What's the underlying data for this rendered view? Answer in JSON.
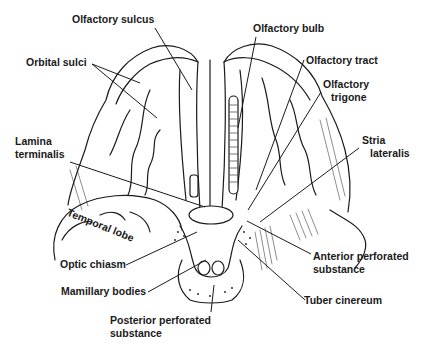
{
  "diagram": {
    "labels": {
      "olfactory_sulcus": "Olfactory sulcus",
      "olfactory_bulb": "Olfactory bulb",
      "orbital_sulci": "Orbital sulci",
      "olfactory_tract": "Olfactory tract",
      "olfactory_trigone_1": "Olfactory",
      "olfactory_trigone_2": "trigone",
      "lamina_terminalis_1": "Lamina",
      "lamina_terminalis_2": "terminalis",
      "stria_lateralis_1": "Stria",
      "stria_lateralis_2": "lateralis",
      "temporal_lobe": "Temporal lobe",
      "optic_chiasm": "Optic chiasm",
      "anterior_perforated_1": "Anterior perforated",
      "anterior_perforated_2": "substance",
      "mamillary_bodies": "Mamillary bodies",
      "tuber_cinereum": "Tuber cinereum",
      "posterior_perforated_1": "Posterior perforated",
      "posterior_perforated_2": "substance"
    },
    "colors": {
      "line": "#1a1a1a",
      "background": "#ffffff"
    }
  }
}
